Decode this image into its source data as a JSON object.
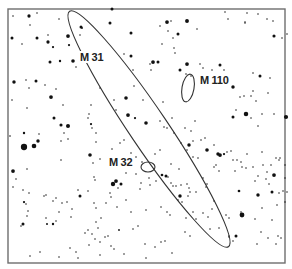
{
  "chart": {
    "title": "",
    "frame": {
      "x": 8,
      "y": 9,
      "width": 277,
      "height": 254
    },
    "colors": {
      "background": "#ffffff",
      "frame": "#6e6e6e",
      "stars": "#111111",
      "outline": "#333333"
    }
  },
  "galaxies": [
    {
      "id": "m31",
      "label": "M 31",
      "cx": 149,
      "cy": 129,
      "rx": 142,
      "ry": 19,
      "rotate": 56,
      "label_x": 79,
      "label_y": 57
    },
    {
      "id": "m110",
      "label": "M 110",
      "cx": 188,
      "cy": 88,
      "rx": 6,
      "ry": 14,
      "rotate": 10,
      "label_x": 199,
      "label_y": 80
    },
    {
      "id": "m32",
      "label": "M 32",
      "cx": 148,
      "cy": 167,
      "rx": 7,
      "ry": 5,
      "rotate": 0,
      "label_x": 108,
      "label_y": 162
    }
  ],
  "stars": [
    [
      13,
      16,
      1
    ],
    [
      29,
      16,
      2.2
    ],
    [
      37,
      13,
      1
    ],
    [
      30,
      25,
      1
    ],
    [
      12,
      38,
      2
    ],
    [
      22,
      44,
      1
    ],
    [
      37,
      38,
      2
    ],
    [
      48,
      42,
      2.2
    ],
    [
      53,
      47,
      1.5
    ],
    [
      48,
      35,
      1
    ],
    [
      59,
      19,
      1
    ],
    [
      68,
      36,
      2.5
    ],
    [
      69,
      45,
      1.5
    ],
    [
      73,
      61,
      2.4
    ],
    [
      76,
      67,
      1
    ],
    [
      60,
      61,
      1.6
    ],
    [
      50,
      62,
      2
    ],
    [
      26,
      80,
      1
    ],
    [
      36,
      81,
      2
    ],
    [
      45,
      85,
      1
    ],
    [
      14,
      82,
      2.3
    ],
    [
      29,
      88,
      1
    ],
    [
      51,
      97,
      2.5
    ],
    [
      56,
      89,
      1
    ],
    [
      63,
      105,
      1
    ],
    [
      27,
      108,
      1
    ],
    [
      54,
      118,
      2
    ],
    [
      61,
      125,
      2.1
    ],
    [
      68,
      126,
      2.7
    ],
    [
      91,
      124,
      1.5
    ],
    [
      88,
      118,
      1
    ],
    [
      89,
      114,
      1
    ],
    [
      81,
      27,
      2
    ],
    [
      82,
      28,
      1.2
    ],
    [
      80,
      35,
      1
    ],
    [
      112,
      9,
      2
    ],
    [
      110,
      23,
      2
    ],
    [
      131,
      33,
      2
    ],
    [
      131,
      56,
      2
    ],
    [
      124,
      54,
      1
    ],
    [
      133,
      70,
      1
    ],
    [
      134,
      86,
      1
    ],
    [
      126,
      98,
      2.4
    ],
    [
      128,
      115,
      2.5
    ],
    [
      135,
      118,
      1.5
    ],
    [
      143,
      100,
      1
    ],
    [
      114,
      100,
      1
    ],
    [
      116,
      110,
      1
    ],
    [
      100,
      88,
      1
    ],
    [
      92,
      128,
      1
    ],
    [
      91,
      105,
      1
    ],
    [
      160,
      26,
      1
    ],
    [
      167,
      22,
      2.5
    ],
    [
      171,
      21,
      1
    ],
    [
      178,
      34,
      2
    ],
    [
      168,
      31,
      1
    ],
    [
      173,
      38,
      1
    ],
    [
      162,
      44,
      1
    ],
    [
      174,
      48,
      1
    ],
    [
      175,
      53,
      1
    ],
    [
      197,
      29,
      1
    ],
    [
      187,
      21,
      2.6
    ],
    [
      228,
      19,
      1
    ],
    [
      247,
      13,
      1
    ],
    [
      258,
      14,
      1
    ],
    [
      245,
      22,
      1
    ],
    [
      267,
      19,
      1
    ],
    [
      245,
      23,
      1
    ],
    [
      225,
      12,
      1
    ],
    [
      273,
      21,
      1
    ],
    [
      287,
      34,
      1
    ],
    [
      274,
      36,
      2.1
    ],
    [
      282,
      38,
      1
    ],
    [
      153,
      62,
      2.5
    ],
    [
      158,
      62,
      2
    ],
    [
      150,
      64,
      1
    ],
    [
      151,
      70,
      1
    ],
    [
      180,
      70,
      2
    ],
    [
      186,
      74,
      1
    ],
    [
      187,
      64,
      2.5
    ],
    [
      200,
      64,
      1
    ],
    [
      203,
      68,
      1
    ],
    [
      220,
      65,
      2
    ],
    [
      224,
      70,
      1
    ],
    [
      201,
      76,
      1
    ],
    [
      191,
      76,
      1
    ],
    [
      204,
      85,
      1
    ],
    [
      210,
      84,
      1
    ],
    [
      212,
      70,
      1
    ],
    [
      253,
      73,
      1
    ],
    [
      260,
      76,
      2
    ],
    [
      270,
      78,
      1
    ],
    [
      244,
      96,
      1
    ],
    [
      251,
      96,
      1
    ],
    [
      253,
      91,
      1
    ],
    [
      268,
      93,
      1
    ],
    [
      233,
      87,
      2.3
    ],
    [
      240,
      97,
      1
    ],
    [
      236,
      110,
      1
    ],
    [
      233,
      117,
      2
    ],
    [
      246,
      114,
      3
    ],
    [
      262,
      114,
      1
    ],
    [
      274,
      114,
      1
    ],
    [
      286,
      117,
      2.8
    ],
    [
      256,
      101,
      1
    ],
    [
      258,
      126,
      1
    ],
    [
      251,
      118,
      1
    ],
    [
      12,
      100,
      1
    ],
    [
      163,
      102,
      1
    ],
    [
      172,
      118,
      1
    ],
    [
      146,
      123,
      2.4
    ],
    [
      160,
      121,
      1
    ],
    [
      164,
      127,
      1
    ],
    [
      167,
      128,
      1
    ],
    [
      174,
      133,
      1
    ],
    [
      185,
      128,
      1
    ],
    [
      191,
      131,
      1
    ],
    [
      195,
      121,
      1
    ],
    [
      24,
      147,
      4.2
    ],
    [
      34,
      146,
      3.1
    ],
    [
      38,
      141,
      2.3
    ],
    [
      24,
      133,
      1.6
    ],
    [
      10,
      136,
      1.1
    ],
    [
      39,
      134,
      1
    ],
    [
      61,
      141,
      1
    ],
    [
      64,
      133,
      1
    ],
    [
      68,
      139,
      1
    ],
    [
      61,
      160,
      1
    ],
    [
      13,
      171,
      2.5
    ],
    [
      16,
      179,
      1
    ],
    [
      27,
      169,
      1
    ],
    [
      13,
      187,
      1
    ],
    [
      23,
      190,
      1
    ],
    [
      96,
      133,
      1
    ],
    [
      96,
      142,
      1
    ],
    [
      90,
      155,
      2.4
    ],
    [
      93,
      163,
      1
    ],
    [
      100,
      159,
      1
    ],
    [
      112,
      149,
      1
    ],
    [
      29,
      193,
      1
    ],
    [
      24,
      202,
      1.5
    ],
    [
      26,
      204,
      1
    ],
    [
      28,
      211,
      1
    ],
    [
      27,
      216,
      1
    ],
    [
      23,
      224,
      2
    ],
    [
      21,
      226,
      1
    ],
    [
      44,
      196,
      1
    ],
    [
      46,
      195,
      1
    ],
    [
      53,
      201,
      1
    ],
    [
      56,
      198,
      1
    ],
    [
      62,
      203,
      1
    ],
    [
      67,
      202,
      1
    ],
    [
      46,
      218,
      1
    ],
    [
      47,
      224,
      1.3
    ],
    [
      56,
      221,
      1
    ],
    [
      53,
      224,
      1.6
    ],
    [
      59,
      212,
      1
    ],
    [
      71,
      217,
      1
    ],
    [
      72,
      209,
      1
    ],
    [
      95,
      180,
      1
    ],
    [
      94,
      177,
      1
    ],
    [
      78,
      190,
      1
    ],
    [
      80,
      196,
      2
    ],
    [
      88,
      191,
      1
    ],
    [
      94,
      203,
      1
    ],
    [
      96,
      222,
      1
    ],
    [
      98,
      228,
      1
    ],
    [
      106,
      203,
      1
    ],
    [
      111,
      197,
      1
    ],
    [
      117,
      207,
      1
    ],
    [
      126,
      200,
      1
    ],
    [
      131,
      212,
      1
    ],
    [
      113,
      184,
      2.9
    ],
    [
      116,
      181,
      2.5
    ],
    [
      121,
      184,
      2
    ],
    [
      118,
      188,
      1
    ],
    [
      146,
      210,
      1
    ],
    [
      140,
      189,
      1
    ],
    [
      138,
      226,
      1
    ],
    [
      133,
      229,
      1
    ],
    [
      145,
      244,
      1
    ],
    [
      149,
      178,
      1
    ],
    [
      161,
      207,
      1
    ],
    [
      167,
      212,
      1
    ],
    [
      170,
      215,
      1
    ],
    [
      178,
      200,
      1
    ],
    [
      182,
      202,
      1
    ],
    [
      186,
      218,
      1
    ],
    [
      193,
      212,
      1
    ],
    [
      203,
      213,
      1
    ],
    [
      208,
      217,
      1
    ],
    [
      214,
      201,
      1
    ],
    [
      96,
      208,
      1
    ],
    [
      88,
      230,
      1
    ],
    [
      92,
      234,
      1
    ],
    [
      95,
      239,
      1
    ],
    [
      105,
      237,
      1
    ],
    [
      108,
      236,
      1
    ],
    [
      100,
      242,
      1
    ],
    [
      89,
      245,
      1
    ],
    [
      100,
      255,
      1
    ],
    [
      111,
      246,
      1
    ],
    [
      162,
      175,
      1.8
    ],
    [
      166,
      176,
      2
    ],
    [
      168,
      177,
      1
    ],
    [
      173,
      186,
      1
    ],
    [
      176,
      186,
      1
    ],
    [
      181,
      185,
      1
    ],
    [
      189,
      188,
      1
    ],
    [
      190,
      192,
      1
    ],
    [
      188,
      196,
      1
    ],
    [
      171,
      183,
      1
    ],
    [
      180,
      196,
      2.3
    ],
    [
      187,
      184,
      1
    ],
    [
      196,
      192,
      1
    ],
    [
      203,
      178,
      1
    ],
    [
      206,
      187,
      1
    ],
    [
      207,
      184,
      1
    ],
    [
      214,
      167,
      1
    ],
    [
      216,
      165,
      1
    ],
    [
      219,
      171,
      1
    ],
    [
      218,
      154,
      2.3
    ],
    [
      220,
      155,
      2.5
    ],
    [
      224,
      154,
      1.5
    ],
    [
      227,
      152,
      1
    ],
    [
      231,
      151,
      1
    ],
    [
      233,
      160,
      1
    ],
    [
      237,
      160,
      1
    ],
    [
      235,
      171,
      1
    ],
    [
      241,
      162,
      1
    ],
    [
      242,
      167,
      1
    ],
    [
      246,
      168,
      1
    ],
    [
      253,
      167,
      1
    ],
    [
      263,
      165,
      1
    ],
    [
      267,
      172,
      1
    ],
    [
      271,
      165,
      1
    ],
    [
      276,
      158,
      1
    ],
    [
      280,
      158,
      1
    ],
    [
      279,
      160,
      1
    ],
    [
      277,
      205,
      1
    ],
    [
      247,
      154,
      1
    ],
    [
      262,
      152,
      1
    ],
    [
      258,
      176,
      1
    ],
    [
      255,
      181,
      1
    ],
    [
      266,
      179,
      1
    ],
    [
      269,
      184,
      1
    ],
    [
      274,
      175,
      2.5
    ],
    [
      285,
      165,
      1
    ],
    [
      285,
      178,
      1
    ],
    [
      239,
      191,
      1.8
    ],
    [
      258,
      195,
      2.3
    ],
    [
      262,
      208,
      1
    ],
    [
      241,
      212,
      1
    ],
    [
      229,
      218,
      1
    ],
    [
      219,
      228,
      1
    ],
    [
      210,
      229,
      1
    ],
    [
      196,
      219,
      1
    ],
    [
      185,
      232,
      1
    ],
    [
      190,
      236,
      1
    ],
    [
      212,
      209,
      1
    ],
    [
      226,
      215,
      1
    ],
    [
      229,
      237,
      1
    ],
    [
      233,
      241,
      1
    ],
    [
      236,
      236,
      2
    ],
    [
      229,
      236,
      1
    ],
    [
      242,
      215,
      3.2
    ],
    [
      255,
      219,
      1
    ],
    [
      257,
      244,
      1
    ],
    [
      261,
      232,
      1
    ],
    [
      268,
      238,
      1
    ],
    [
      276,
      244,
      1
    ],
    [
      281,
      238,
      1
    ],
    [
      272,
      220,
      1
    ],
    [
      272,
      192,
      2
    ],
    [
      279,
      193,
      1
    ],
    [
      283,
      191,
      1
    ],
    [
      287,
      192,
      1
    ],
    [
      285,
      202,
      1
    ],
    [
      278,
      236,
      1
    ],
    [
      119,
      230,
      1.2
    ],
    [
      114,
      249,
      1
    ],
    [
      124,
      254,
      1
    ],
    [
      155,
      247,
      1
    ],
    [
      161,
      242,
      1
    ],
    [
      165,
      241,
      1
    ],
    [
      172,
      253,
      1
    ],
    [
      146,
      258,
      1
    ],
    [
      110,
      193,
      1
    ],
    [
      101,
      218,
      1
    ],
    [
      70,
      248,
      1
    ],
    [
      76,
      252,
      1
    ],
    [
      40,
      252,
      1
    ],
    [
      30,
      256,
      1
    ],
    [
      59,
      257,
      1
    ],
    [
      78,
      258,
      1
    ],
    [
      85,
      233,
      1
    ],
    [
      136,
      157,
      1
    ],
    [
      131,
      153,
      1
    ],
    [
      120,
      143,
      1
    ],
    [
      124,
      140,
      1
    ],
    [
      142,
      162,
      1
    ],
    [
      155,
      154,
      1
    ],
    [
      160,
      150,
      1
    ],
    [
      181,
      143,
      1
    ],
    [
      189,
      145,
      2.3
    ],
    [
      193,
      141,
      1
    ],
    [
      201,
      140,
      1
    ],
    [
      205,
      138,
      1
    ],
    [
      207,
      150,
      2.4
    ],
    [
      214,
      145,
      1
    ],
    [
      198,
      158,
      1
    ],
    [
      193,
      157,
      1
    ],
    [
      187,
      150,
      1
    ],
    [
      179,
      169,
      1
    ],
    [
      171,
      164,
      1
    ],
    [
      156,
      181,
      1
    ],
    [
      150,
      185,
      1
    ],
    [
      141,
      183,
      1
    ],
    [
      136,
      174,
      1
    ],
    [
      126,
      173,
      1
    ]
  ]
}
